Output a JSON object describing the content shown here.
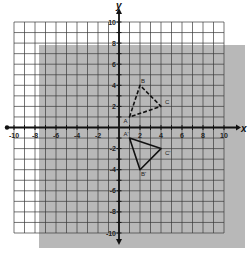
{
  "chart_data": {
    "type": "scatter",
    "title": "",
    "xlabel": "x",
    "ylabel": "y",
    "xlim": [
      -10,
      10
    ],
    "ylim": [
      -10,
      10
    ],
    "grid": true,
    "x_tick_labels": [
      "-10",
      "-8",
      "-6",
      "-4",
      "-2",
      "2",
      "4",
      "6",
      "8",
      "10"
    ],
    "x_tick_values": [
      -10,
      -8,
      -6,
      -4,
      -2,
      2,
      4,
      6,
      8,
      10
    ],
    "y_tick_labels": [
      "10",
      "8",
      "6",
      "4",
      "2",
      "-2",
      "-4",
      "-6",
      "-8",
      "-10"
    ],
    "y_tick_values": [
      10,
      8,
      6,
      4,
      2,
      -2,
      -4,
      -6,
      -8,
      -10
    ],
    "shapes": [
      {
        "name": "preimage-triangle-ABC",
        "style": "dashed",
        "vertices": [
          {
            "label": "A",
            "x": 1,
            "y": 1
          },
          {
            "label": "B",
            "x": 2,
            "y": 4
          },
          {
            "label": "C",
            "x": 4,
            "y": 2
          }
        ]
      },
      {
        "name": "image-triangle-A'B'C'",
        "style": "solid",
        "vertices": [
          {
            "label": "A'",
            "x": 1,
            "y": -1
          },
          {
            "label": "B'",
            "x": 2,
            "y": -4
          },
          {
            "label": "C'",
            "x": 4,
            "y": -2
          }
        ]
      }
    ],
    "overlay": {
      "description": "gray shaded rectangle offset behind grid",
      "color": "#a9a9a9"
    }
  },
  "colors": {
    "grid": "#3a3a3a",
    "axis": "#111111",
    "shading": "#ababab",
    "background": "#ffffff"
  }
}
